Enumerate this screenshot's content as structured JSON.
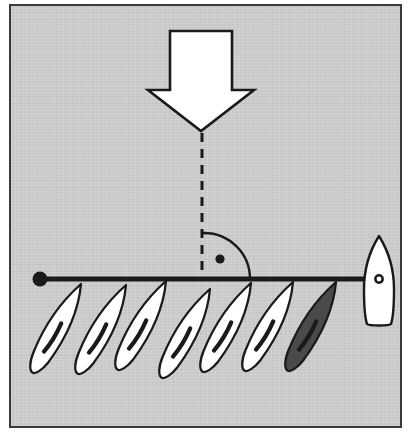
{
  "figure": {
    "background_color": "#c9c9c9",
    "frame_border_color": "#3a3a3a",
    "ink_color": "#1a1a1a",
    "fill_white": "#ffffff",
    "fill_dark": "#4a4a4a",
    "frame": {
      "x": 9,
      "y": 4,
      "width": 393,
      "height": 424,
      "border_width": 2
    }
  },
  "elements": {
    "load_arrow": {
      "name": "downward-load-arrow",
      "direction": "down",
      "fill": "#ffffff",
      "stroke": "#1a1a1a",
      "shaft_left": 168,
      "shaft_right": 230,
      "top": 29,
      "head_left": 146,
      "head_right": 252,
      "head_top": 88,
      "tip_x": 199,
      "tip_y": 129
    },
    "dashed_line": {
      "name": "vertical-dashed-axis",
      "x": 200,
      "y_start": 131,
      "y_end": 277,
      "dash": "9 7",
      "stroke": "#1a1a1a",
      "stroke_width": 3
    },
    "angle_arc": {
      "name": "quarter-angle-arc",
      "center_x": 202,
      "center_y": 277,
      "radius": 46,
      "sweep": "quarter",
      "from": "vertical-up",
      "to": "horizontal-right",
      "stroke": "#1a1a1a",
      "stroke_width": 2.4
    },
    "pivot_dot": {
      "name": "angle-center-dot",
      "cx": 218,
      "cy": 257,
      "r": 4.6,
      "fill": "#1a1a1a"
    },
    "horizontal_bar": {
      "name": "horizontal-shaft",
      "x_start": 36,
      "x_end": 380,
      "y": 277,
      "stroke": "#1a1a1a",
      "stroke_width": 5
    },
    "end_dot": {
      "name": "shaft-left-end-dot",
      "cx": 38,
      "cy": 277,
      "r": 7.5,
      "fill": "#1a1a1a"
    },
    "hull": {
      "name": "hull-body",
      "fill": "#ffffff",
      "stroke": "#1a1a1a",
      "stroke_width": 2.4,
      "bow_x": 377,
      "bow_y": 234,
      "left_x": 364,
      "right_x": 391,
      "stern_y": 322,
      "port_hole": {
        "cx": 377,
        "cy": 277,
        "r_outer": 4.8,
        "r_inner": 2.4
      }
    },
    "blades": {
      "name": "blade-array",
      "count": 7,
      "tilt_degrees": -62,
      "length": 92,
      "width": 21,
      "white_fill": "#ffffff",
      "dark_fill": "#4a4a4a",
      "stroke": "#1a1a1a",
      "items": [
        {
          "index": 0,
          "tip_x": 79,
          "tip_y": 287,
          "filled": false,
          "label": "blade-1"
        },
        {
          "index": 1,
          "tip_x": 124,
          "tip_y": 288,
          "filled": false,
          "label": "blade-2"
        },
        {
          "index": 2,
          "tip_x": 164,
          "tip_y": 284,
          "filled": false,
          "label": "blade-3"
        },
        {
          "index": 3,
          "tip_x": 208,
          "tip_y": 292,
          "filled": false,
          "label": "blade-4"
        },
        {
          "index": 4,
          "tip_x": 249,
          "tip_y": 286,
          "filled": false,
          "label": "blade-5"
        },
        {
          "index": 5,
          "tip_x": 291,
          "tip_y": 285,
          "filled": false,
          "label": "blade-6"
        },
        {
          "index": 6,
          "tip_x": 334,
          "tip_y": 285,
          "filled": true,
          "label": "blade-7-highlighted"
        }
      ]
    }
  }
}
